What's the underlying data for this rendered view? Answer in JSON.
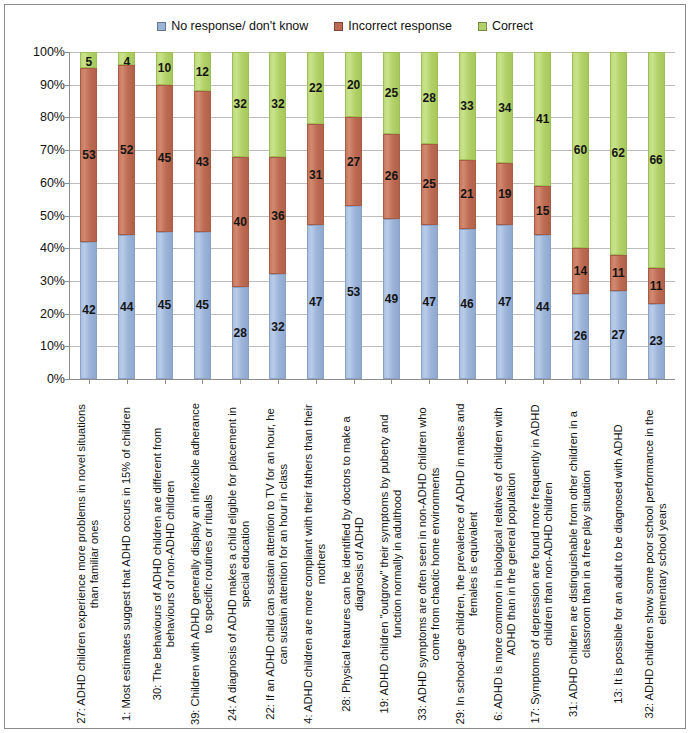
{
  "legend": {
    "position": "top-center",
    "items": [
      {
        "label": "No response/ don't know",
        "color": "#9cb4d8",
        "key": "no_response"
      },
      {
        "label": "Incorrect response",
        "color": "#bd6b52",
        "key": "incorrect"
      },
      {
        "label": "Correct",
        "color": "#b2d168",
        "key": "correct"
      }
    ]
  },
  "axis": {
    "y_ticks": [
      "0%",
      "10%",
      "20%",
      "30%",
      "40%",
      "50%",
      "60%",
      "70%",
      "80%",
      "90%",
      "100%"
    ]
  },
  "chart_data": {
    "type": "bar",
    "subtype": "stacked-vertical-100percent",
    "title": "",
    "subtitle": "",
    "xlabel": "",
    "ylabel": "",
    "ylim": [
      0,
      100
    ],
    "ytick_labels": [
      "0%",
      "10%",
      "20%",
      "30%",
      "40%",
      "50%",
      "60%",
      "70%",
      "80%",
      "90%",
      "100%"
    ],
    "ytick_values": [
      0,
      10,
      20,
      30,
      40,
      50,
      60,
      70,
      80,
      90,
      100
    ],
    "grid": true,
    "legend_position": "top-center",
    "categories": [
      "27: ADHD children experience more problems in novel situations than familiar ones",
      "1: Most estimates suggest that ADHD occurs in 15% of children",
      "30: The behaviours of ADHD children are different from behaviours of non-ADHD children",
      "39: Children with ADHD generally display an inflexible adherance to specific routines or rituals",
      "24: A diagnosis of ADHD makes a child eligible for placement in special education",
      "22: If an ADHD child can sustain attention to TV for an hour, he can sustain attention for an hour in class",
      "4: ADHD children are more compliant with their fathers than their mothers",
      "28: Physical features can be identified by doctors to make a diagnosis of ADHD",
      "19: ADHD children \"outgrow\" their symptoms by puberty and function normally in adulthood",
      "33: ADHD symptoms are often seen in non-ADHD children who come from chaotic home environments",
      "29: In school-age children, the prevalence of ADHD in males and females is equivalent",
      "6: ADHD is more common in biological relatives of children with ADHD than in the general population",
      "17: Symptoms of depression are found more frequently in ADHD children than non-ADHD children",
      "31: ADHD children are distinguishable from other children in a classroom than in a free play situation",
      "13: It is possible for an adult to be diagnosed with ADHD",
      "32: ADHD children show some poor school performance in the elementary school years"
    ],
    "series": [
      {
        "name": "No response/ don't know",
        "color": "#9cb4d8",
        "values": [
          42,
          44,
          45,
          45,
          28,
          32,
          47,
          53,
          49,
          47,
          46,
          47,
          44,
          26,
          27,
          23
        ]
      },
      {
        "name": "Incorrect response",
        "color": "#bd6b52",
        "values": [
          53,
          52,
          45,
          43,
          40,
          36,
          31,
          27,
          26,
          25,
          21,
          19,
          15,
          14,
          11,
          11
        ]
      },
      {
        "name": "Correct",
        "color": "#b2d168",
        "values": [
          5,
          4,
          10,
          12,
          32,
          32,
          22,
          20,
          25,
          28,
          33,
          34,
          41,
          60,
          62,
          66
        ]
      }
    ]
  }
}
